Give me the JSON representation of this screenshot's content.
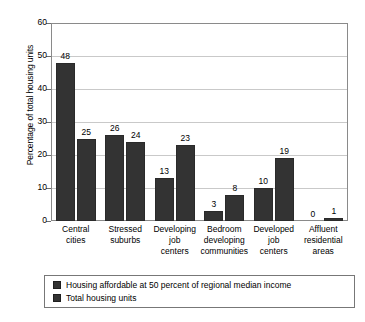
{
  "chart_data": {
    "type": "bar",
    "title": "",
    "xlabel": "",
    "ylabel": "Percentage of total housing units",
    "ylim": [
      0,
      60
    ],
    "yticks": [
      "0",
      "10",
      "20",
      "30",
      "40",
      "50",
      "60"
    ],
    "grid": true,
    "legend_position": "bottom",
    "categories": [
      "Central cities",
      "Stressed suburbs",
      "Developing job centers",
      "Bedroom developing communities",
      "Developed job centers",
      "Affluent residential areas"
    ],
    "category_lines": [
      [
        "Central",
        "cities"
      ],
      [
        "Stressed",
        "suburbs"
      ],
      [
        "Developing",
        "job",
        "centers"
      ],
      [
        "Bedroom",
        "developing",
        "communities"
      ],
      [
        "Developed",
        "job",
        "centers"
      ],
      [
        "Affluent",
        "residential",
        "areas"
      ]
    ],
    "series": [
      {
        "name": "Housing affordable at 50 percent of regional median income",
        "color": "#333333",
        "values": [
          48,
          26,
          13,
          3,
          10,
          0
        ]
      },
      {
        "name": "Total housing units",
        "color": "#333333",
        "values": [
          25,
          24,
          23,
          8,
          19,
          1
        ]
      }
    ]
  },
  "colors": {
    "bar": "#333333",
    "gridline": "#c9c9c9",
    "frame": "#8a8a8a",
    "legend_border": "#777777",
    "text": "#000000"
  }
}
